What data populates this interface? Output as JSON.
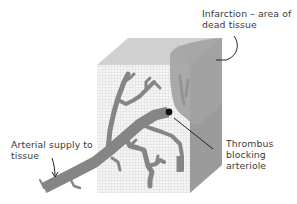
{
  "diagram": {
    "labels": {
      "infarction_line1": "Infarction – area of",
      "infarction_line2": "dead tissue",
      "arterial_line1": "Arterial supply to",
      "arterial_line2": "tissue",
      "thrombus_line1": "Thrombus",
      "thrombus_line2": "blocking",
      "thrombus_line3": "arteriole"
    },
    "colors": {
      "grid_line": "#c9c9c9",
      "front_face": "#f4f4f4",
      "top_face": "#d0d0d0",
      "right_face": "#9a9a9a",
      "infarction": "#a3a3a3",
      "vessel": "#858585",
      "thrombus": "#111111",
      "text": "#3a3a3a"
    }
  }
}
